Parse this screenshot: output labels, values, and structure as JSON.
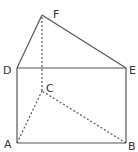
{
  "diagram": {
    "type": "triangular-prism",
    "colors": {
      "line": "#555555",
      "label": "#333333",
      "background": "#ffffff"
    },
    "labels": {
      "A": "A",
      "B": "B",
      "C": "C",
      "D": "D",
      "E": "E",
      "F": "F"
    },
    "vertices": {
      "A": [
        17,
        143
      ],
      "B": [
        126,
        143
      ],
      "C": [
        42,
        91
      ],
      "D": [
        17,
        68
      ],
      "E": [
        126,
        68
      ],
      "F": [
        42,
        15
      ]
    },
    "solid_edges": [
      "AB",
      "AD",
      "BE",
      "DE",
      "DF",
      "EF"
    ],
    "dashed_edges": [
      "AC",
      "BC",
      "CF"
    ]
  }
}
